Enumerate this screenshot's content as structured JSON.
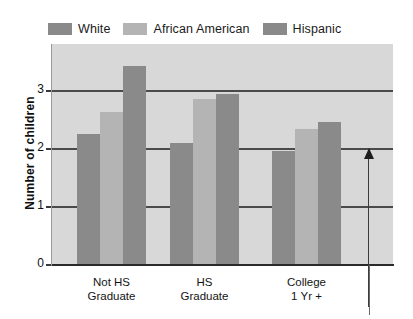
{
  "chart_data": {
    "type": "bar",
    "title": "",
    "xlabel": "",
    "ylabel": "Number of children",
    "ylim": [
      0,
      3.83
    ],
    "yticks": [
      0,
      1,
      2,
      3
    ],
    "grid": true,
    "legend_position": "top-left",
    "categories": [
      "Not HS Graduate",
      "HS Graduate",
      "College 1 Yr +"
    ],
    "category_lines": [
      [
        "Not HS",
        "Graduate"
      ],
      [
        "HS",
        "Graduate"
      ],
      [
        "College",
        "1 Yr +"
      ]
    ],
    "series": [
      {
        "name": "White",
        "color": "#8a8a8a",
        "values": [
          2.25,
          2.08,
          1.95
        ]
      },
      {
        "name": "African American",
        "color": "#b4b4b4",
        "values": [
          2.62,
          2.85,
          2.32
        ]
      },
      {
        "name": "Hispanic",
        "color": "#8a8a8a",
        "values": [
          3.42,
          2.93,
          2.45
        ]
      }
    ],
    "annotations": [
      {
        "name": "upward-arrow",
        "direction": "up",
        "text": ""
      }
    ],
    "plot_background": "#d8d8d8",
    "gridline_color": "#4a4a4a",
    "axis_color": "#2a2a2a"
  },
  "legend": {
    "items": [
      {
        "label": "White",
        "color": "#8a8a8a"
      },
      {
        "label": "African American",
        "color": "#b4b4b4"
      },
      {
        "label": "Hispanic",
        "color": "#8a8a8a"
      }
    ]
  },
  "yaxis": {
    "title": "Number of children",
    "ticks": [
      "0",
      "1",
      "2",
      "3"
    ]
  }
}
